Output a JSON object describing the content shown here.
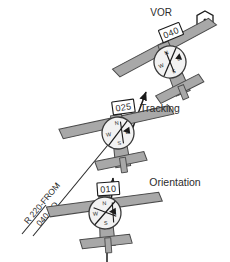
{
  "figure": {
    "background": "#ffffff",
    "ink": "#2b2b2b",
    "wing_fill": "#a8a8a8",
    "wing_stroke": "#4a4a4a",
    "instrument_fill": "#f2f2f2",
    "instrument_stroke": "#3a3a3a",
    "needle_color": "#1a1a1a"
  },
  "station": {
    "label": "VOR",
    "symbol_name": "vor-hexagon-icon"
  },
  "phase_labels": {
    "tracking": "Tracking",
    "orientation": "Orientation"
  },
  "radial_callout": {
    "line1": "R 220-FROM",
    "line2": "040-TO"
  },
  "compass_points": {
    "north": "N",
    "east": "E",
    "south": "S",
    "west": "W"
  },
  "aircraft": [
    {
      "id": "top",
      "position_name": "aircraft-top",
      "heading_readout": "040",
      "phase": "Tracking",
      "bank_deg": -22,
      "cx": 170,
      "cy": 62,
      "cdi_deflection": 0,
      "to_from": "TO"
    },
    {
      "id": "middle",
      "position_name": "aircraft-middle",
      "heading_readout": "025",
      "phase": "Intercept",
      "bank_deg": -8,
      "cx": 118,
      "cy": 133,
      "cdi_deflection": 4,
      "to_from": "TO"
    },
    {
      "id": "bottom",
      "position_name": "aircraft-bottom",
      "heading_readout": "010",
      "phase": "Orientation",
      "bank_deg": -4,
      "cx": 105,
      "cy": 213,
      "cdi_deflection": 8,
      "to_from": "TO"
    }
  ]
}
